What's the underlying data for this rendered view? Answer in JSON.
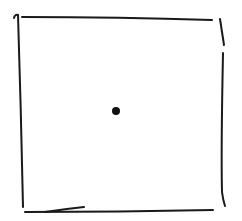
{
  "sketch": {
    "description": "Hand-drawn square outline with a single dot at its center",
    "colors": {
      "background": "#ffffff",
      "ink": "#1a1a1a"
    },
    "strokes": {
      "top": "M22,17 Q120,17 212,20",
      "left_hook": "M14,18 Q15,14 18,15",
      "left": "M18,15 Q21,110 23,207",
      "right_upper": "M220,19 Q222,32 224,45",
      "right_lower": "M223,53 Q221,150 222,192 Q223,200 225,206",
      "bottom": "M25,212 Q120,212 213,210",
      "bottom_extra": "M45,212 Q65,209 84,207"
    },
    "dot": {
      "cx": 116,
      "cy": 111,
      "r": 4
    }
  }
}
